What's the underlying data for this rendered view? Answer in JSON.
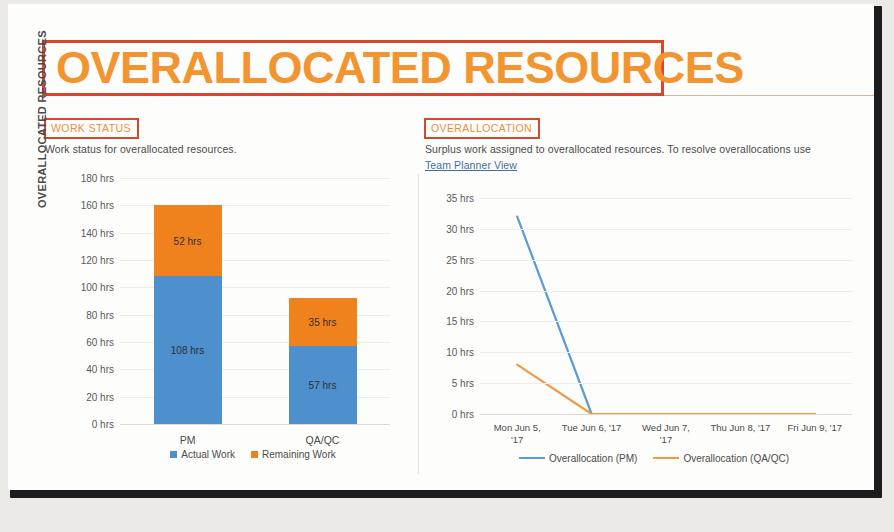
{
  "page": {
    "title": "OVERALLOCATED RESOURCES",
    "title_color": "#f2942f",
    "annotation_color": "#d6472b"
  },
  "work_status": {
    "section_label": "WORK STATUS",
    "description": "Work status for overallocated resources.",
    "axis_title": "OVERALLOCATED RESOURCES"
  },
  "overallocation": {
    "section_label": "OVERALLOCATION",
    "description": "Surplus work assigned to overallocated resources. To resolve overallocations use",
    "link_label": "Team Planner View"
  },
  "chart_data": [
    {
      "type": "bar",
      "id": "work-status-chart",
      "title": "WORK STATUS",
      "stacked": true,
      "xlabel": "",
      "ylabel": "OVERALLOCATED RESOURCES",
      "ylim": [
        0,
        180
      ],
      "yticks": [
        0,
        20,
        40,
        60,
        80,
        100,
        120,
        140,
        160,
        180
      ],
      "ytick_labels": [
        "0 hrs",
        "20 hrs",
        "40 hrs",
        "60 hrs",
        "80 hrs",
        "100 hrs",
        "120 hrs",
        "140 hrs",
        "160 hrs",
        "180 hrs"
      ],
      "grid": true,
      "legend_position": "bottom",
      "categories": [
        "PM",
        "QA/QC"
      ],
      "series": [
        {
          "name": "Actual Work",
          "color": "#4e90cd",
          "values": [
            108,
            57
          ],
          "labels": [
            "108 hrs",
            "57 hrs"
          ]
        },
        {
          "name": "Remaining Work",
          "color": "#f0821e",
          "values": [
            52,
            35
          ],
          "labels": [
            "52 hrs",
            "35 hrs"
          ]
        }
      ]
    },
    {
      "type": "line",
      "id": "overallocation-chart",
      "title": "OVERALLOCATION",
      "xlabel": "",
      "ylabel": "",
      "ylim": [
        0,
        35
      ],
      "yticks": [
        0,
        5,
        10,
        15,
        20,
        25,
        30,
        35
      ],
      "ytick_labels": [
        "0 hrs",
        "5 hrs",
        "10 hrs",
        "15 hrs",
        "20 hrs",
        "25 hrs",
        "30 hrs",
        "35 hrs"
      ],
      "grid": true,
      "legend_position": "bottom",
      "x": [
        "Mon Jun 5, '17",
        "Tue Jun 6, '17",
        "Wed Jun 7, '17",
        "Thu Jun 8, '17",
        "Fri Jun 9, '17"
      ],
      "x_tick_lines": [
        [
          "Mon Jun 5,",
          "'17"
        ],
        [
          "Tue Jun 6, '17"
        ],
        [
          "Wed Jun 7,",
          "'17"
        ],
        [
          "Thu Jun 8, '17"
        ],
        [
          "Fri Jun 9, '17"
        ]
      ],
      "series": [
        {
          "name": "Overallocation (PM)",
          "color": "#5b9bd5",
          "values": [
            32,
            0,
            0,
            0,
            0
          ]
        },
        {
          "name": "Overallocation (QA/QC)",
          "color": "#ed9b47",
          "values": [
            8,
            0,
            0,
            0,
            0
          ]
        }
      ]
    }
  ]
}
